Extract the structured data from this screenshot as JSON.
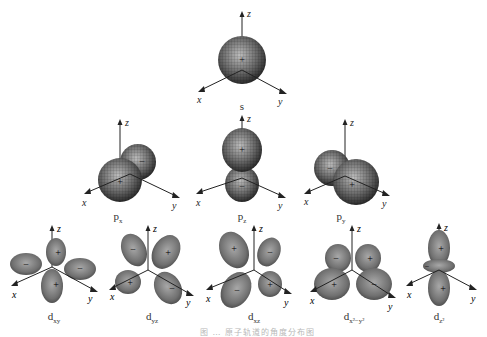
{
  "figure": {
    "caption": "图 … 原子轨道的角度分布图",
    "colors": {
      "lobe_dark": "#3a3a3a",
      "lobe_mid": "#6e6e6e",
      "lobe_light": "#9a9a9a",
      "axis": "#222222"
    }
  },
  "orbitals": [
    {
      "id": "s",
      "label": "s",
      "sub": "",
      "signs": [
        "+"
      ]
    },
    {
      "id": "px",
      "label": "p",
      "sub": "x",
      "signs": [
        "+",
        "−"
      ]
    },
    {
      "id": "pz",
      "label": "p",
      "sub": "z",
      "signs": [
        "+",
        "−"
      ]
    },
    {
      "id": "py",
      "label": "p",
      "sub": "y",
      "signs": [
        "−",
        "+"
      ]
    },
    {
      "id": "dxy",
      "label": "d",
      "sub": "xy",
      "signs": [
        "+",
        "−",
        "−",
        "+"
      ]
    },
    {
      "id": "dyz",
      "label": "d",
      "sub": "yz",
      "signs": [
        "−",
        "+",
        "+",
        "−"
      ]
    },
    {
      "id": "dxz",
      "label": "d",
      "sub": "xz",
      "signs": [
        "+",
        "−",
        "−",
        "+"
      ]
    },
    {
      "id": "dx2y2",
      "label": "d",
      "sub": "x²−y²",
      "signs": [
        "−",
        "+",
        "+",
        "−"
      ]
    },
    {
      "id": "dz2",
      "label": "d",
      "sub": "z²",
      "signs": [
        "+",
        "−",
        "+"
      ]
    }
  ],
  "axes": {
    "x": "x",
    "y": "y",
    "z": "z"
  }
}
